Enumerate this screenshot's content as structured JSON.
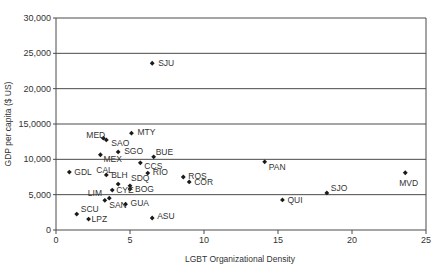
{
  "chart_data": {
    "type": "scatter",
    "title": "",
    "xlabel": "LGBT Organizational Density",
    "ylabel": "GDP per capita ($ US)",
    "xlim": [
      0,
      25
    ],
    "ylim": [
      0,
      30000
    ],
    "x_ticks": [
      0,
      5,
      10,
      15,
      20,
      25
    ],
    "x_tick_labels": [
      "0",
      "5",
      "10",
      "15",
      "20",
      "25"
    ],
    "y_ticks": [
      0,
      5000,
      10000,
      15000,
      20000,
      25000,
      30000
    ],
    "y_tick_labels": [
      "0",
      "5,000",
      "10,000",
      "15,0000",
      "20,000",
      "25,000",
      "30,000"
    ],
    "grid": {
      "horizontal": true,
      "vertical": false
    },
    "legend": null,
    "points": [
      {
        "label": "SJU",
        "x": 6.5,
        "y": 23600,
        "lx": 6,
        "ly": 3
      },
      {
        "label": "MTY",
        "x": 5.1,
        "y": 13700,
        "lx": 6,
        "ly": 2
      },
      {
        "label": "MED",
        "x": 3.2,
        "y": 13000,
        "lx": -17,
        "ly": 0
      },
      {
        "label": "SAO",
        "x": 3.4,
        "y": 12750,
        "lx": 5,
        "ly": 6
      },
      {
        "label": "SGO",
        "x": 4.2,
        "y": 11050,
        "lx": 6,
        "ly": 2
      },
      {
        "label": "MEX",
        "x": 3.0,
        "y": 10650,
        "lx": 3,
        "ly": 7
      },
      {
        "label": "BUE",
        "x": 6.6,
        "y": 10350,
        "lx": 2,
        "ly": -2
      },
      {
        "label": "CCS",
        "x": 5.7,
        "y": 9500,
        "lx": 4,
        "ly": 6
      },
      {
        "label": "PAN",
        "x": 14.1,
        "y": 9650,
        "lx": 4,
        "ly": 8
      },
      {
        "label": "GDL",
        "x": 0.9,
        "y": 8200,
        "lx": 5,
        "ly": 3
      },
      {
        "label": "CAL",
        "x": 3.4,
        "y": 7800,
        "lx": -10,
        "ly": -2
      },
      {
        "label": "RIO",
        "x": 6.2,
        "y": 8050,
        "lx": 5,
        "ly": 2
      },
      {
        "label": "ROS",
        "x": 8.6,
        "y": 7500,
        "lx": 5,
        "ly": 2
      },
      {
        "label": "COR",
        "x": 9.0,
        "y": 6800,
        "lx": 5,
        "ly": 3
      },
      {
        "label": "MVD",
        "x": 23.6,
        "y": 8100,
        "lx": -6,
        "ly": 13
      },
      {
        "label": "BLH",
        "x": 4.2,
        "y": 6500,
        "lx": -7,
        "ly": -6
      },
      {
        "label": "SDQ",
        "x": 5.0,
        "y": 6250,
        "lx": 1,
        "ly": -5
      },
      {
        "label": "BOG",
        "x": 5.0,
        "y": 5800,
        "lx": 5,
        "ly": 3
      },
      {
        "label": "CYE",
        "x": 3.8,
        "y": 5650,
        "lx": 4,
        "ly": 3
      },
      {
        "label": "SJO",
        "x": 18.3,
        "y": 5250,
        "lx": 4,
        "ly": -2
      },
      {
        "label": "QUI",
        "x": 15.3,
        "y": 4250,
        "lx": 5,
        "ly": 3
      },
      {
        "label": "LIM",
        "x": 3.3,
        "y": 4200,
        "lx": -17,
        "ly": -4
      },
      {
        "label": "SAN",
        "x": 3.6,
        "y": 4500,
        "lx": 0,
        "ly": 10
      },
      {
        "label": "GUA",
        "x": 4.7,
        "y": 3650,
        "lx": 5,
        "ly": 2
      },
      {
        "label": "SCU",
        "x": 1.4,
        "y": 2250,
        "lx": 4,
        "ly": -2
      },
      {
        "label": "LPZ",
        "x": 2.2,
        "y": 1550,
        "lx": 3,
        "ly": 3
      },
      {
        "label": "ASU",
        "x": 6.5,
        "y": 1700,
        "lx": 5,
        "ly": 1
      }
    ]
  },
  "colors": {
    "marker": "#1a1a1a",
    "axis": "#4a4a4a",
    "text": "#333333",
    "background": "#ffffff"
  }
}
